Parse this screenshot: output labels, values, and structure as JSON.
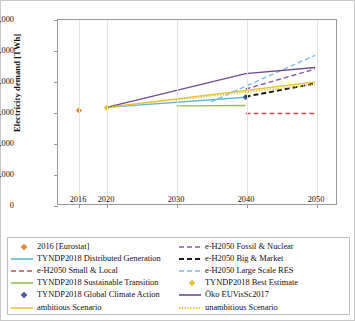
{
  "chart_data": {
    "type": "line",
    "title": "",
    "xlabel": "",
    "ylabel": "Electricity demand [TWh]",
    "xlim": [
      2013,
      2053
    ],
    "ylim": [
      0,
      6000
    ],
    "ytick_labels": [
      "0",
      "1,000",
      "2,000",
      "3,000",
      "4,000",
      "5,000",
      "6,000"
    ],
    "ytick_values": [
      0,
      1000,
      2000,
      3000,
      4000,
      5000,
      6000
    ],
    "xtick_labels": [
      "2016",
      "2020",
      "2030",
      "2040",
      "2050"
    ],
    "xtick_values": [
      2016,
      2020,
      2030,
      2040,
      2050
    ],
    "grid": "vertical",
    "legend_position": "bottom",
    "series": [
      {
        "name": "2016 [Eurostat]",
        "style": "marker",
        "marker": "diamond",
        "color": "#e2892f",
        "x": [
          2016
        ],
        "values": [
          3050
        ]
      },
      {
        "name": "TYNDP2018 Distributed Generation",
        "style": "solid",
        "color": "#5bb8d7",
        "x": [
          2020,
          2040
        ],
        "values": [
          3150,
          3480
        ]
      },
      {
        "name": "e-H2050 Small & Local",
        "style": "dashed",
        "color": "#c0504d",
        "x": [
          2040,
          2050
        ],
        "values": [
          2950,
          2950
        ]
      },
      {
        "name": "TYNDP2018 Sustainable Transition",
        "style": "solid",
        "color": "#9bbb59",
        "x": [
          2030,
          2040
        ],
        "values": [
          3200,
          3210
        ]
      },
      {
        "name": "TYNDP2018 Global Climate Action",
        "style": "marker",
        "marker": "diamond",
        "color": "#4a5fa5",
        "x": [
          2040
        ],
        "values": [
          3480
        ]
      },
      {
        "name": "ambitious Scenario",
        "style": "solid",
        "color": "#e8c33a",
        "x": [
          2020,
          2050
        ],
        "values": [
          3150,
          3980
        ]
      },
      {
        "name": "e-H2050 Fossil & Nuclear",
        "style": "dashed",
        "color": "#7b5ea7",
        "x": [
          2040,
          2050
        ],
        "values": [
          3750,
          4400
        ]
      },
      {
        "name": "e-H2050 Big & Market",
        "style": "dashed-bold",
        "color": "#1a1a1a",
        "x": [
          2040,
          2050
        ],
        "values": [
          3500,
          3930
        ]
      },
      {
        "name": "e-H2050 Large Scale RES",
        "style": "dashed",
        "color": "#7db9e8",
        "x": [
          2035,
          2050
        ],
        "values": [
          3330,
          4850
        ]
      },
      {
        "name": "TYNDP2018 Best Estimate",
        "style": "marker",
        "marker": "diamond",
        "color": "#e8c33a",
        "x": [
          2020
        ],
        "values": [
          3140
        ]
      },
      {
        "name": "Öko EUVisSc2017",
        "style": "solid",
        "color": "#6f4b8e",
        "x": [
          2020,
          2040,
          2050
        ],
        "values": [
          3150,
          4250,
          4450
        ]
      },
      {
        "name": "unambitious Scenario",
        "style": "dotted",
        "color": "#e8c33a",
        "x": [
          2020,
          2050
        ],
        "values": [
          3150,
          3900
        ]
      }
    ]
  },
  "legend": {
    "left_column": [
      "2016 [Eurostat]",
      "TYNDP2018 Distributed Generation",
      "e-H2050 Small & Local",
      "TYNDP2018 Sustainable Transition",
      "TYNDP2018 Global Climate Action",
      "ambitious Scenario"
    ],
    "right_column": [
      "e-H2050 Fossil & Nuclear",
      "e-H2050 Big & Market",
      "e-H2050 Large Scale RES",
      "TYNDP2018 Best Estimate",
      "Öko EUVisSc2017",
      "unambitious Scenario"
    ]
  }
}
